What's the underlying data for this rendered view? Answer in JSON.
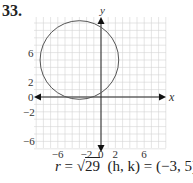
{
  "problem_number": "33.",
  "caption": {
    "r_label": "r",
    "equals": " = ",
    "sqrt_value": "29",
    "center_text": "(h, k) = (−3, 5)"
  },
  "chart_data": {
    "type": "scatter",
    "title": "",
    "xlabel": "x",
    "ylabel": "y",
    "xlim": [
      -9,
      9
    ],
    "ylim": [
      -7,
      10
    ],
    "grid": true,
    "x_tick_labels": [
      "-6",
      "-2",
      "0",
      "2",
      "6"
    ],
    "y_tick_labels": [
      "6",
      "2",
      "0",
      "-2",
      "-6"
    ],
    "shapes": [
      {
        "kind": "circle",
        "center": [
          -3,
          5
        ],
        "radius": 5.385,
        "radius_label": "sqrt(29)"
      }
    ],
    "annotations": [
      "r = √29",
      "(h, k) = (−3, 5)"
    ]
  }
}
